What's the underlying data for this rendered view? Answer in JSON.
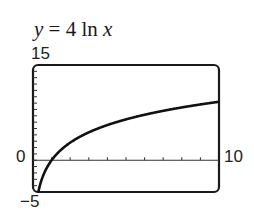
{
  "title": {
    "y_var": "y",
    "equals": "=",
    "coef": "4",
    "func": "ln",
    "x_var": "x"
  },
  "labels": {
    "ymax": "15",
    "ymin": "−5",
    "xmin": "0",
    "xmax": "10"
  },
  "chart_data": {
    "type": "line",
    "title": "y = 4 ln x",
    "xlabel": "",
    "ylabel": "",
    "xlim": [
      0,
      10
    ],
    "ylim": [
      -5,
      15
    ],
    "x_tick_step": 1,
    "y_tick_step": 1,
    "grid": false,
    "series": [
      {
        "name": "y = 4 ln x",
        "x": [
          0.29,
          0.5,
          0.75,
          1,
          1.5,
          2,
          3,
          4,
          5,
          6,
          7,
          8,
          9,
          10
        ],
        "y": [
          -4.95,
          -2.77,
          -1.15,
          0,
          1.62,
          2.77,
          4.39,
          5.55,
          6.44,
          7.17,
          7.78,
          8.32,
          8.79,
          9.21
        ]
      }
    ]
  }
}
